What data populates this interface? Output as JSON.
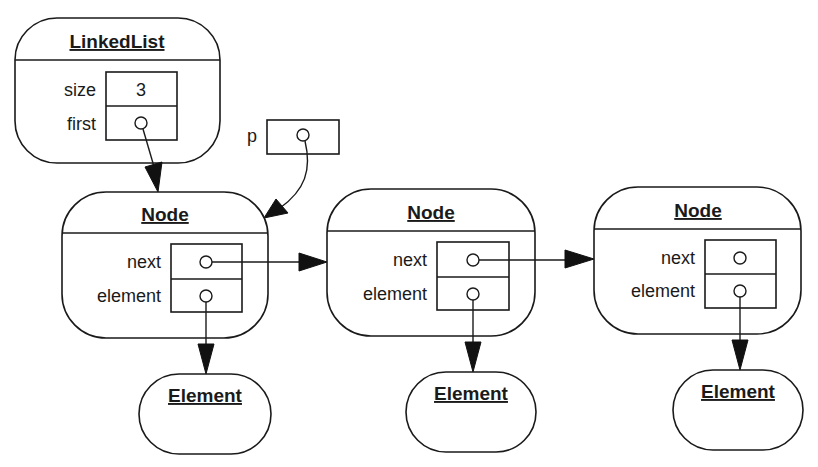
{
  "linked_list": {
    "title": "LinkedList",
    "fields": [
      {
        "label": "size",
        "value": "3"
      },
      {
        "label": "first",
        "value": "pointer"
      }
    ]
  },
  "pointer_var": {
    "label": "p",
    "value": "pointer"
  },
  "nodes": [
    {
      "title": "Node",
      "fields": [
        {
          "label": "next",
          "value": "pointer"
        },
        {
          "label": "element",
          "value": "pointer"
        }
      ]
    },
    {
      "title": "Node",
      "fields": [
        {
          "label": "next",
          "value": "pointer"
        },
        {
          "label": "element",
          "value": "pointer"
        }
      ]
    },
    {
      "title": "Node",
      "fields": [
        {
          "label": "next",
          "value": "null-pointer"
        },
        {
          "label": "element",
          "value": "pointer"
        }
      ]
    }
  ],
  "elements": [
    {
      "title": "Element"
    },
    {
      "title": "Element"
    },
    {
      "title": "Element"
    }
  ],
  "colors": {
    "stroke": "#1a1a1a",
    "background": "#ffffff"
  }
}
